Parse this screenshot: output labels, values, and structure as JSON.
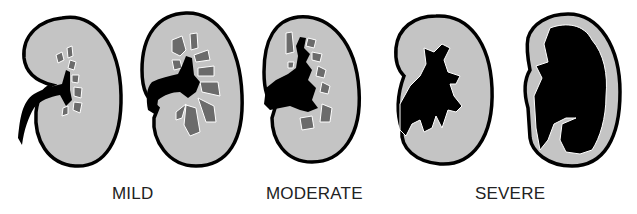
{
  "figure": {
    "labels": [
      {
        "id": "mild",
        "text": "MILD"
      },
      {
        "id": "moderate",
        "text": "MODERATE"
      },
      {
        "id": "severe",
        "text": "SEVERE"
      }
    ],
    "kidneys": [
      {
        "grade": "mild",
        "index": 1
      },
      {
        "grade": "mild",
        "index": 2
      },
      {
        "grade": "moderate",
        "index": 3
      },
      {
        "grade": "severe",
        "index": 4
      },
      {
        "grade": "severe",
        "index": 5
      }
    ],
    "colors": {
      "parenchyma": "#c4c4c4",
      "calyx": "#6b6b6b",
      "pelvis": "#000000",
      "outline": "#000000",
      "background": "#ffffff"
    }
  }
}
